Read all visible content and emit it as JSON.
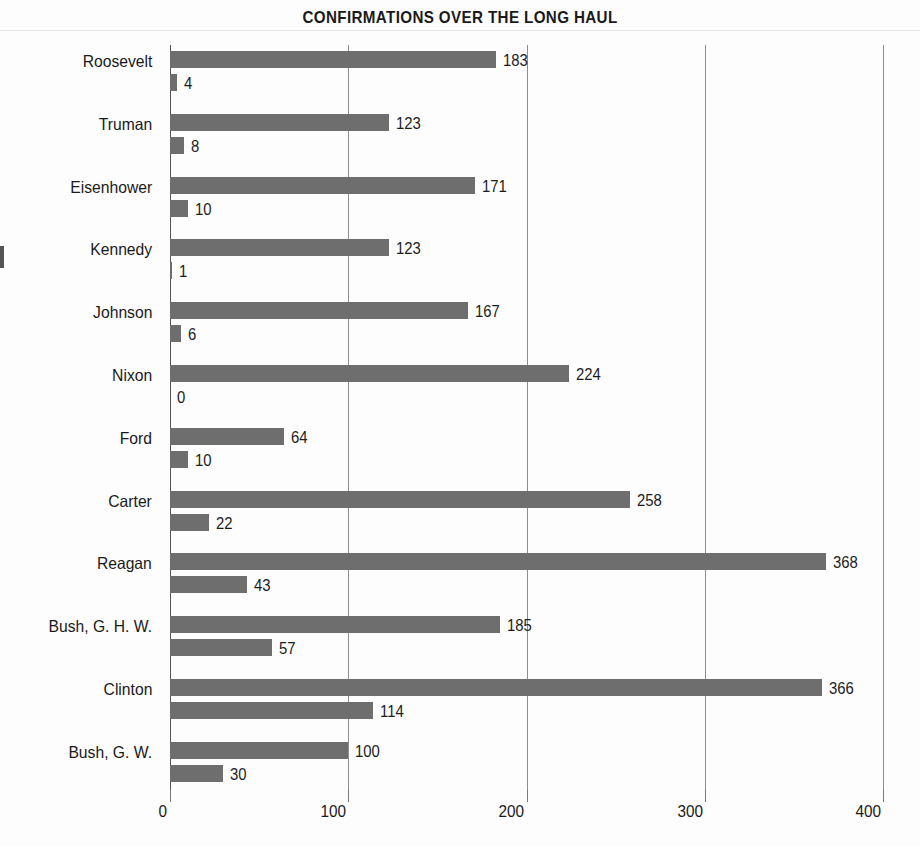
{
  "chart_data": {
    "type": "bar",
    "orientation": "horizontal",
    "title": "CONFIRMATIONS OVER THE LONG HAUL",
    "xlabel": "",
    "ylabel": "",
    "xlim": [
      0,
      400
    ],
    "xticks": [
      "0",
      "100",
      "200",
      "300",
      "400"
    ],
    "xtick_values": [
      0,
      100,
      200,
      300,
      400
    ],
    "grid": true,
    "legend": "none",
    "bar_color": "#6e6e6e",
    "categories": [
      "Roosevelt",
      "Truman",
      "Eisenhower",
      "Kennedy",
      "Johnson",
      "Nixon",
      "Ford",
      "Carter",
      "Reagan",
      "Bush, G. H. W.",
      "Clinton",
      "Bush, G. W."
    ],
    "series": [
      {
        "name": "series-1",
        "values": [
          183,
          123,
          171,
          123,
          167,
          224,
          64,
          258,
          368,
          185,
          366,
          100
        ]
      },
      {
        "name": "series-2",
        "values": [
          4,
          8,
          10,
          1,
          6,
          0,
          10,
          22,
          43,
          57,
          114,
          30
        ]
      }
    ],
    "data_labels": [
      [
        "183",
        "4"
      ],
      [
        "123",
        "8"
      ],
      [
        "171",
        "10"
      ],
      [
        "123",
        "1"
      ],
      [
        "167",
        "6"
      ],
      [
        "224",
        "0"
      ],
      [
        "64",
        "10"
      ],
      [
        "258",
        "22"
      ],
      [
        "368",
        "43"
      ],
      [
        "185",
        "57"
      ],
      [
        "366",
        "114"
      ],
      [
        "100",
        "30"
      ]
    ]
  }
}
